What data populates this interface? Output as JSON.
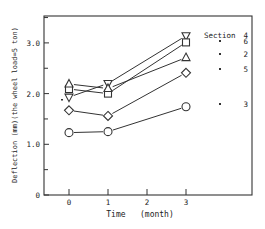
{
  "chart_data": {
    "type": "line",
    "title": "",
    "xlabel": "Time   (month)",
    "ylabel": "Deflection (mm)(the wheel load=5 ton)",
    "x": [
      0,
      1,
      3
    ],
    "x_ticks": [
      "0",
      "1",
      "2",
      "3"
    ],
    "y_ticks": [
      "0",
      "1.0",
      "2.0",
      "3.0"
    ],
    "ylim": [
      0,
      3.5
    ],
    "xlim": [
      -0.6,
      4.8
    ],
    "grid": false,
    "legend_position": "right",
    "legend_header": "Section",
    "series": [
      {
        "name": "4",
        "marker": "triangle-down",
        "values": [
          1.93,
          2.2,
          3.14
        ]
      },
      {
        "name": "6",
        "marker": "square",
        "values": [
          2.09,
          2.0,
          3.01
        ]
      },
      {
        "name": "2",
        "marker": "triangle-up",
        "values": [
          2.19,
          2.1,
          2.71
        ]
      },
      {
        "name": "5",
        "marker": "diamond",
        "values": [
          1.67,
          1.56,
          2.41
        ]
      },
      {
        "name": "3",
        "marker": "circle",
        "values": [
          1.23,
          1.25,
          1.74
        ]
      }
    ]
  },
  "labels": {
    "section": "Section",
    "ditto": "\"",
    "xlabel": "Time   (month)",
    "ylabel": "Deflection (mm)(the wheel load=5 ton)"
  }
}
